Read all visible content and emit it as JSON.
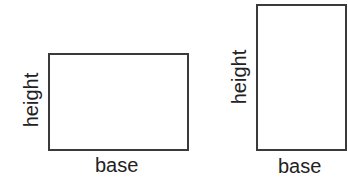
{
  "figures": [
    {
      "shape": "rectangle",
      "orientation": "landscape",
      "height_label": "height",
      "base_label": "base"
    },
    {
      "shape": "rectangle",
      "orientation": "portrait",
      "height_label": "height",
      "base_label": "base"
    }
  ],
  "colors": {
    "stroke": "#3a3a3a",
    "text": "#222222",
    "background": "#ffffff"
  }
}
